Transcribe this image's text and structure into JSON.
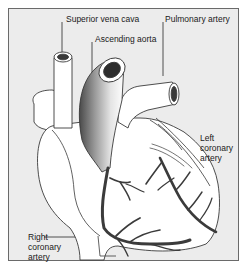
{
  "figure": {
    "type": "anatomical-diagram",
    "colors": {
      "background": "#ececec",
      "border": "#6a6a6a",
      "heart_fill": "#ffffff",
      "outline": "#3a3a3a",
      "artery": "#3b3b3b",
      "aorta_shade": "#8a8a8a",
      "label_text": "#1a1a1a"
    }
  },
  "labels": {
    "superior_vena_cava": "Superior vena cava",
    "ascending_aorta": "Ascending aorta",
    "pulmonary_artery": "Pulmonary artery",
    "left_coronary_artery": "Left\ncoronary\nartery",
    "right_coronary_artery": "Right\ncoronary\nartery"
  }
}
